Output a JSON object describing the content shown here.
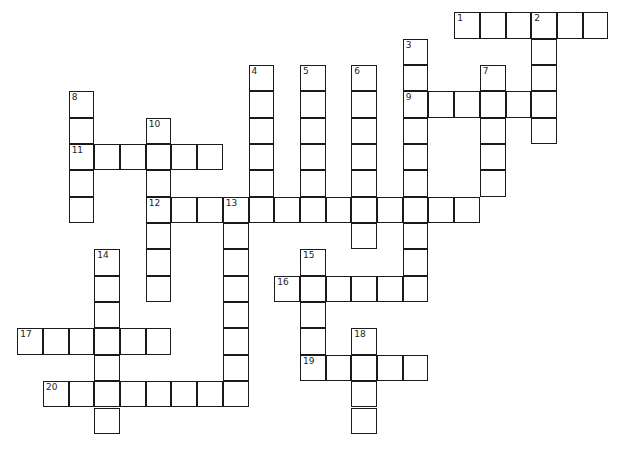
{
  "puzzle": {
    "type": "crossword",
    "cell_size": [
      25.7,
      26.35
    ],
    "origin": [
      18,
      13
    ],
    "colors": {
      "border": "#1a1a1a",
      "cell": "#ffffff",
      "background": "#ffffff",
      "number": "#222222"
    },
    "entries": [
      {
        "number": "1",
        "direction": "across",
        "col": 17,
        "row": 0,
        "length": 6
      },
      {
        "number": "2",
        "direction": "down",
        "col": 20,
        "row": 0,
        "length": 5
      },
      {
        "number": "3",
        "direction": "down",
        "col": 15,
        "row": 1,
        "length": 10
      },
      {
        "number": "4",
        "direction": "down",
        "col": 9,
        "row": 2,
        "length": 6
      },
      {
        "number": "5",
        "direction": "down",
        "col": 11,
        "row": 2,
        "length": 6
      },
      {
        "number": "6",
        "direction": "down",
        "col": 13,
        "row": 2,
        "length": 7
      },
      {
        "number": "7",
        "direction": "down",
        "col": 18,
        "row": 2,
        "length": 5
      },
      {
        "number": "8",
        "direction": "down",
        "col": 2,
        "row": 3,
        "length": 5
      },
      {
        "number": "9",
        "direction": "across",
        "col": 15,
        "row": 3,
        "length": 6
      },
      {
        "number": "10",
        "direction": "down",
        "col": 5,
        "row": 4,
        "length": 7
      },
      {
        "number": "11",
        "direction": "across",
        "col": 2,
        "row": 5,
        "length": 6
      },
      {
        "number": "12",
        "direction": "across",
        "col": 5,
        "row": 7,
        "length": 13
      },
      {
        "number": "13",
        "direction": "down",
        "col": 8,
        "row": 7,
        "length": 8
      },
      {
        "number": "14",
        "direction": "down",
        "col": 3,
        "row": 9,
        "length": 7
      },
      {
        "number": "15",
        "direction": "down",
        "col": 11,
        "row": 9,
        "length": 5
      },
      {
        "number": "16",
        "direction": "across",
        "col": 10,
        "row": 10,
        "length": 6
      },
      {
        "number": "17",
        "direction": "across",
        "col": 0,
        "row": 12,
        "length": 6
      },
      {
        "number": "18",
        "direction": "down",
        "col": 13,
        "row": 12,
        "length": 4
      },
      {
        "number": "19",
        "direction": "across",
        "col": 11,
        "row": 13,
        "length": 5
      },
      {
        "number": "20",
        "direction": "across",
        "col": 1,
        "row": 14,
        "length": 8
      }
    ]
  }
}
